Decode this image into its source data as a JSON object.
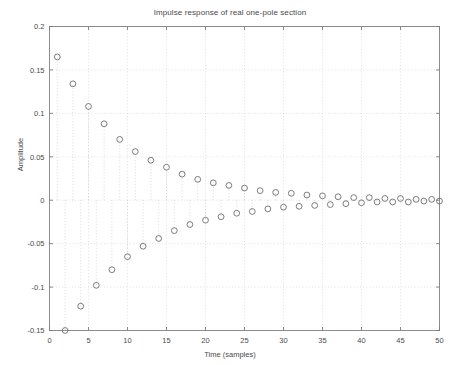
{
  "chart_data": {
    "type": "scatter",
    "title": "Impulse response of real one-pole section",
    "xlabel": "Time (samples)",
    "ylabel": "Amplitude",
    "xlim": [
      0,
      50
    ],
    "ylim": [
      -0.15,
      0.2
    ],
    "grid": true,
    "legend": null,
    "marker": "circle-open",
    "stems": true,
    "xticks": [
      0,
      5,
      10,
      15,
      20,
      25,
      30,
      35,
      40,
      45,
      50
    ],
    "xtick_labels": [
      "0",
      "5",
      "10",
      "15",
      "20",
      "25",
      "30",
      "35",
      "40",
      "45",
      "50"
    ],
    "yticks": [
      -0.15,
      -0.1,
      -0.05,
      0,
      0.05,
      0.1,
      0.15,
      0.2
    ],
    "ytick_labels": [
      "-0.15",
      "-0.1",
      "-0.05",
      "0",
      "0.05",
      "0.1",
      "0.15",
      "0.2"
    ],
    "x": [
      1,
      2,
      3,
      4,
      5,
      6,
      7,
      8,
      9,
      10,
      11,
      12,
      13,
      14,
      15,
      16,
      17,
      18,
      19,
      20,
      21,
      22,
      23,
      24,
      25,
      26,
      27,
      28,
      29,
      30,
      31,
      32,
      33,
      34,
      35,
      36,
      37,
      38,
      39,
      40,
      41,
      42,
      43,
      44,
      45,
      46,
      47,
      48,
      49,
      50
    ],
    "y": [
      0.165,
      -0.15,
      0.134,
      -0.122,
      0.108,
      -0.098,
      0.088,
      -0.08,
      0.07,
      -0.065,
      0.056,
      -0.053,
      0.046,
      -0.044,
      0.038,
      -0.035,
      0.03,
      -0.028,
      0.024,
      -0.023,
      0.02,
      -0.019,
      0.017,
      -0.015,
      0.014,
      -0.013,
      0.011,
      -0.01,
      0.009,
      -0.008,
      0.008,
      -0.007,
      0.006,
      -0.006,
      0.005,
      -0.005,
      0.004,
      -0.004,
      0.003,
      -0.003,
      0.003,
      -0.002,
      0.002,
      -0.002,
      0.002,
      -0.002,
      0.001,
      -0.001,
      0.001,
      -0.001
    ],
    "series_name": "impulse response"
  },
  "colors": {
    "background": "#ffffff",
    "axis": "#8d8d8d",
    "grid": "#d4d4d4",
    "marker": "#6e6e6e",
    "text": "#4a4a4a"
  }
}
